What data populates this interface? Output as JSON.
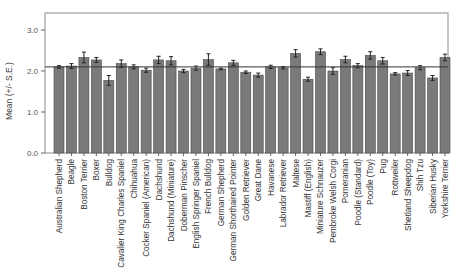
{
  "chart_data": {
    "type": "bar",
    "title": "",
    "xlabel": "",
    "ylabel": "Mean (+/- S.E.)",
    "ylim": [
      0,
      3.4
    ],
    "yticks": [
      "0.0",
      "1.0",
      "2.0",
      "3.0"
    ],
    "grid": false,
    "legend": null,
    "reference_line": 2.1,
    "bar_color": "#7a7a7a",
    "categories": [
      "Australian Shepherd",
      "Beagle",
      "Boston Terrier",
      "Boxer",
      "Bulldog",
      "Cavalier King Charles Spaniel",
      "Chihuahua",
      "Cocker Spaniel (American)",
      "Dachshund",
      "Dachshund (Miniature)",
      "Doberman Pinscher",
      "English Springer Spaniel",
      "French Bulldog",
      "German Shepherd",
      "German Shorthaired Pointer",
      "Golden Retriever",
      "Great Dane",
      "Havanese",
      "Labrador Retriever",
      "Maltese",
      "Mastiff (English)",
      "Miniature Schnauzer",
      "Pembroke Welsh Corgi",
      "Pomeranian",
      "Poodle (Standard)",
      "Poodle (Toy)",
      "Pug",
      "Rottweiler",
      "Shetland Sheepdog",
      "Shih Tzu",
      "Siberian Husky",
      "Yorkshire Terrier"
    ],
    "values": [
      2.1,
      2.12,
      2.33,
      2.27,
      1.77,
      2.18,
      2.1,
      2.02,
      2.27,
      2.25,
      2.0,
      2.07,
      2.28,
      2.05,
      2.2,
      1.97,
      1.9,
      2.1,
      2.08,
      2.43,
      1.8,
      2.47,
      2.0,
      2.28,
      2.13,
      2.38,
      2.25,
      1.93,
      1.95,
      2.08,
      1.83,
      2.33
    ],
    "errors": [
      0.03,
      0.06,
      0.13,
      0.06,
      0.12,
      0.09,
      0.05,
      0.05,
      0.09,
      0.1,
      0.04,
      0.05,
      0.14,
      0.02,
      0.06,
      0.03,
      0.05,
      0.04,
      0.03,
      0.09,
      0.05,
      0.07,
      0.08,
      0.08,
      0.05,
      0.09,
      0.08,
      0.03,
      0.06,
      0.05,
      0.06,
      0.08
    ]
  }
}
